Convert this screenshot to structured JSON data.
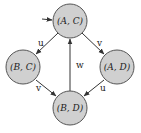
{
  "colors": {
    "node_fill": "#d0d0d0",
    "node_stroke": "#555555",
    "edge": "#333333"
  },
  "nodes": [
    {
      "id": "AC",
      "label": "(A, C)",
      "cx": 70,
      "cy": 21,
      "r": 17,
      "initial": true
    },
    {
      "id": "BC",
      "label": "(B, C)",
      "cx": 23,
      "cy": 67,
      "r": 17
    },
    {
      "id": "AD",
      "label": "(A, D)",
      "cx": 117,
      "cy": 67,
      "r": 17
    },
    {
      "id": "BD",
      "label": "(B, D)",
      "cx": 70,
      "cy": 108,
      "r": 17
    }
  ],
  "edges": [
    {
      "from": "AC",
      "to": "BC",
      "label": "u"
    },
    {
      "from": "AC",
      "to": "AD",
      "label": "v"
    },
    {
      "from": "BC",
      "to": "BD",
      "label": "v"
    },
    {
      "from": "AD",
      "to": "BD",
      "label": "u"
    },
    {
      "from": "BD",
      "to": "AC",
      "label": "w"
    }
  ]
}
